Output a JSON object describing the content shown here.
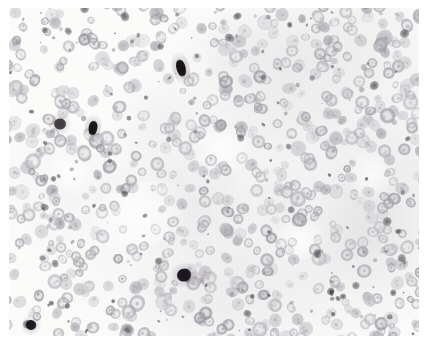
{
  "figure": {
    "domain": "Natural-Image",
    "kind": "photomicrograph",
    "modality": "brightfield-light-microscopy",
    "stain": "immunohistochemistry-nuclear-chromogen-with-counterstain",
    "title": "",
    "caption": "",
    "scale_bar_text": "",
    "magnification_text": "",
    "label_text": "",
    "width_px": 424,
    "height_px": 346
  },
  "frame": {
    "background_color": "#ffffff",
    "margin_left_px": 9,
    "margin_top_px": 8,
    "margin_right_px": 5,
    "margin_bottom_px": 10,
    "has_border": false,
    "border_color": "#ffffff"
  },
  "tissue": {
    "field_background_color": "#fbfbfa",
    "field_tint_color": "#f6f5f4",
    "stroma_color": "#f2f1f0",
    "nucleus_pale_color": "#d8d6da",
    "nucleus_mid_color": "#c2bfc6",
    "nucleus_dark_color": "#a9a5ae",
    "nucleus_rim_color": "#b5b1ba",
    "nucleus_positive_color": "#1a1418",
    "nucleus_strong_color": "#3a343c",
    "speck_color": "#58525a",
    "nucleus_mean_diameter_px": 12,
    "nucleus_min_diameter_px": 7,
    "nucleus_max_diameter_px": 19,
    "approx_nucleus_count": 620,
    "positive_nucleus_count": 5,
    "positive_fraction_text": ""
  },
  "positive_nuclei": [
    {
      "cx": 181,
      "cy": 68,
      "rx": 4.6,
      "ry": 9.0,
      "rot": -14,
      "shade": "#120d12"
    },
    {
      "cx": 93,
      "cy": 128,
      "rx": 4.4,
      "ry": 7.6,
      "rot": 8,
      "shade": "#141014"
    },
    {
      "cx": 184,
      "cy": 275,
      "rx": 7.6,
      "ry": 6.4,
      "rot": -22,
      "shade": "#16101a"
    },
    {
      "cx": 31,
      "cy": 325,
      "rx": 5.6,
      "ry": 5.0,
      "rot": 12,
      "shade": "#1b1520"
    },
    {
      "cx": 60,
      "cy": 124,
      "rx": 6.4,
      "ry": 5.8,
      "rot": 0,
      "shade": "#3e3842"
    }
  ],
  "sparse_zones": [
    {
      "cx": 140,
      "cy": 215,
      "rx": 52,
      "ry": 32,
      "rot": -18
    },
    {
      "cx": 222,
      "cy": 150,
      "rx": 30,
      "ry": 22,
      "rot": 15
    },
    {
      "cx": 300,
      "cy": 240,
      "rx": 26,
      "ry": 20,
      "rot": 0
    },
    {
      "cx": 70,
      "cy": 175,
      "rx": 24,
      "ry": 18,
      "rot": 30
    },
    {
      "cx": 370,
      "cy": 175,
      "rx": 22,
      "ry": 26,
      "rot": 0
    }
  ],
  "dense_zones": [
    {
      "cx": 70,
      "cy": 265,
      "rx": 40,
      "ry": 30,
      "rot": 20
    },
    {
      "cx": 330,
      "cy": 60,
      "rx": 44,
      "ry": 30,
      "rot": -10
    },
    {
      "cx": 255,
      "cy": 305,
      "rx": 46,
      "ry": 26,
      "rot": 5
    },
    {
      "cx": 100,
      "cy": 45,
      "rx": 40,
      "ry": 26,
      "rot": 0
    }
  ],
  "render": {
    "seed": 20240517,
    "nucleus_count": 640,
    "speck_count": 150,
    "vesicular_ring_probability": 0.55,
    "min_center_distance_px": 7
  }
}
